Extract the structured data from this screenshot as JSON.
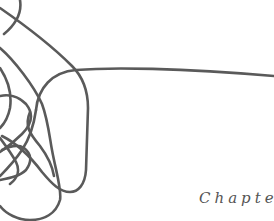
{
  "page": {
    "type": "chapter-opener",
    "heading": {
      "label": "Chapter"
    },
    "illustration": {
      "description": "tangled continuous line scribble",
      "stroke_color": "#5a5a5a"
    }
  }
}
